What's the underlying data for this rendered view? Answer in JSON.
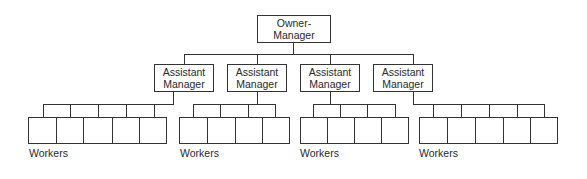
{
  "owner": {
    "line1": "Owner-",
    "line2": "Manager"
  },
  "assistants": [
    {
      "line1": "Assistant",
      "line2": "Manager"
    },
    {
      "line1": "Assistant",
      "line2": "Manager"
    },
    {
      "line1": "Assistant",
      "line2": "Manager"
    },
    {
      "line1": "Assistant",
      "line2": "Manager"
    }
  ],
  "groups": [
    {
      "label": "Workers",
      "worker_count": 5
    },
    {
      "label": "Workers",
      "worker_count": 4
    },
    {
      "label": "Workers",
      "worker_count": 4
    },
    {
      "label": "Workers",
      "worker_count": 5
    }
  ]
}
